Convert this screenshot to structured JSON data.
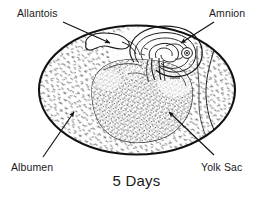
{
  "figure": {
    "caption": "5 Days",
    "background_color": "#ffffff",
    "line_color": "#1a1a1a",
    "stipple_color": "#3a3a3a"
  },
  "labels": {
    "allantois": "Allantois",
    "amnion": "Amnion",
    "albumen": "Albumen",
    "yolk_sac": "Yolk Sac"
  },
  "structures": [
    {
      "name": "egg-shell-outline",
      "label": "Egg shell",
      "center": [
        137,
        90
      ],
      "rx": 99,
      "ry": 65
    },
    {
      "name": "albumen-region",
      "label": "Albumen",
      "center": [
        137,
        90
      ]
    },
    {
      "name": "yolk-sac-region",
      "label": "Yolk Sac",
      "center": [
        140,
        104
      ],
      "rx": 52,
      "ry": 40
    },
    {
      "name": "amnion-spiral",
      "label": "Amnion",
      "center": [
        166,
        46
      ]
    },
    {
      "name": "allantois-pocket",
      "label": "Allantois",
      "center": [
        106,
        42
      ]
    },
    {
      "name": "embryo-eye",
      "label": "Embryo eye",
      "center": [
        187,
        53
      ],
      "r": 5
    }
  ],
  "leaders": [
    {
      "name": "leader-allantois",
      "from": [
        63,
        22
      ],
      "to": [
        110,
        43
      ]
    },
    {
      "name": "leader-amnion",
      "from": [
        214,
        22
      ],
      "to": [
        181,
        43
      ]
    },
    {
      "name": "leader-albumen",
      "from": [
        43,
        157
      ],
      "to": [
        74,
        112
      ]
    },
    {
      "name": "leader-yolk-sac",
      "from": [
        214,
        155
      ],
      "to": [
        169,
        112
      ]
    }
  ]
}
